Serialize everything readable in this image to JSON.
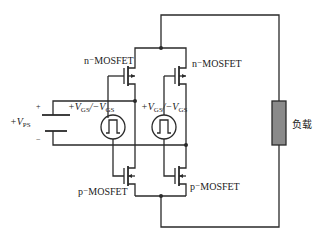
{
  "diagram": {
    "type": "circuit-schematic",
    "components": {
      "supply": {
        "label_prefix": "+V",
        "label_sub": "PS",
        "plus_sign": "+",
        "minus_sign": "−"
      },
      "n_mosfet_left": {
        "label": "n⁻MOSFET"
      },
      "n_mosfet_right": {
        "label": "n⁻MOSFET"
      },
      "p_mosfet_left": {
        "label": "p⁻MOSFET"
      },
      "p_mosfet_right": {
        "label": "p⁻MOSFET"
      },
      "pulse_source_left": {
        "label_plus": "+V",
        "label_sub1": "GS",
        "label_sep": "/−V",
        "label_sub2": "GS",
        "symbol": "pulse"
      },
      "pulse_source_right": {
        "label_plus": "+V",
        "label_sub1": "GS",
        "label_sep": "/−V",
        "label_sub2": "GS",
        "symbol": "pulse"
      },
      "load": {
        "label": "负载",
        "fill_color": "#8a8a8a"
      }
    },
    "colors": {
      "wire": "#2a2a2a",
      "background": "#ffffff",
      "load_fill": "#8a8a8a"
    }
  }
}
